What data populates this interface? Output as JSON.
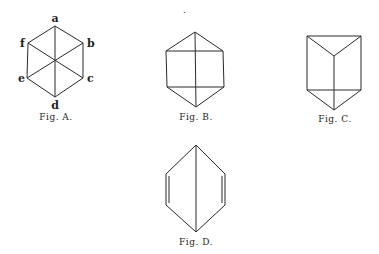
{
  "figures": [
    {
      "id": "A",
      "caption": "Fig. A.",
      "vertex_labels": {
        "a": "a",
        "b": "b",
        "c": "c",
        "d": "d",
        "e": "e",
        "f": "f"
      },
      "description": "Hexagon with three diagonals through the center (a-d, b-e, f-c)"
    },
    {
      "id": "B",
      "caption": "Fig. B.",
      "description": "Hexagonal outline with a horizontal top and bottom chord and a vertical center line"
    },
    {
      "id": "C",
      "caption": "Fig. C.",
      "description": "Triangular prism viewed with top face as a triangle and vertical edges"
    },
    {
      "id": "D",
      "caption": "Fig. D.",
      "description": "Elongated hexagon with double-lined vertical sides and a vertical center line"
    }
  ],
  "stray_mark": "."
}
